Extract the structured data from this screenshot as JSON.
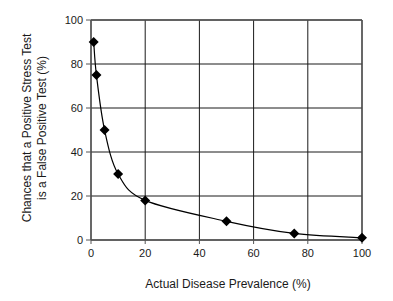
{
  "chart_data": {
    "type": "line",
    "title": "",
    "xlabel": "Actual Disease Prevalence (%)",
    "ylabel_lines": [
      "Chances that a Positive Stress Test",
      "is a False Positive Test (%)"
    ],
    "ylabel": "Chances that a Positive Stress Test is a False Positive Test (%)",
    "xlim": [
      0,
      100
    ],
    "ylim": [
      0,
      100
    ],
    "xticks": [
      0,
      20,
      40,
      60,
      80,
      100
    ],
    "yticks": [
      0,
      20,
      40,
      60,
      80,
      100
    ],
    "grid": true,
    "legend": null,
    "marker": "diamond",
    "series": [
      {
        "name": "False positive chance",
        "smooth": true,
        "x": [
          1,
          2,
          5,
          10,
          20,
          50,
          75,
          100
        ],
        "y": [
          90,
          75,
          50,
          30,
          18,
          8.5,
          3,
          1
        ]
      }
    ],
    "colors": {
      "line": "#000000",
      "marker": "#000000",
      "grid": "#1a1a1a",
      "axis": "#555555",
      "text": "#1a1a1a"
    }
  }
}
